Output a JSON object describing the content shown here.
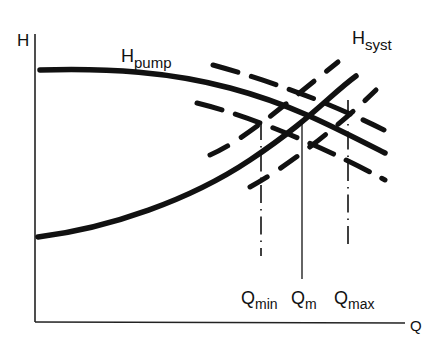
{
  "diagram": {
    "axes": {
      "y_label": "H",
      "x_label": "Q"
    },
    "curves": {
      "pump": {
        "label_main": "H",
        "label_sub": "pump"
      },
      "system": {
        "label_main": "H",
        "label_sub": "syst"
      }
    },
    "markers": [
      {
        "main": "Q",
        "sub": "min",
        "style": "dashed"
      },
      {
        "main": "Q",
        "sub": "m",
        "style": "solid"
      },
      {
        "main": "Q",
        "sub": "max",
        "style": "dashed"
      }
    ],
    "colors": {
      "ink": "#111111",
      "background": "#ffffff"
    }
  }
}
